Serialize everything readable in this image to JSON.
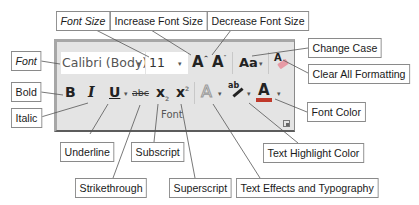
{
  "diagram": {
    "type": "annotated-ribbon-group",
    "ribbon_group": {
      "group_label": "Font",
      "font_name": {
        "value": "Calibri (Body)",
        "dropdown_icon": "chevron-down-icon"
      },
      "font_size": {
        "value": "11",
        "dropdown_icon": "chevron-down-icon"
      },
      "buttons": {
        "increase_font_size": {
          "glyph": "A",
          "icon": "increase-font-size-icon"
        },
        "decrease_font_size": {
          "glyph": "A",
          "icon": "decrease-font-size-icon"
        },
        "change_case": {
          "glyph": "Aa",
          "icon": "change-case-icon"
        },
        "clear_formatting": {
          "glyph": "A",
          "icon": "clear-formatting-icon"
        },
        "bold": {
          "glyph": "B",
          "icon": "bold-icon"
        },
        "italic": {
          "glyph": "I",
          "icon": "italic-icon"
        },
        "underline": {
          "glyph": "U",
          "icon": "underline-icon"
        },
        "strikethrough": {
          "glyph": "abc",
          "icon": "strikethrough-icon"
        },
        "subscript": {
          "glyph": "x",
          "sub": "2",
          "icon": "subscript-icon"
        },
        "superscript": {
          "glyph": "x",
          "sup": "2",
          "icon": "superscript-icon"
        },
        "text_effects": {
          "glyph": "A",
          "icon": "text-effects-icon"
        },
        "highlight": {
          "glyph": "ab",
          "icon": "highlighter-icon"
        },
        "font_color": {
          "glyph": "A",
          "icon": "font-color-icon",
          "color": "#c0392b"
        }
      }
    },
    "callouts": {
      "font": "Font",
      "font_size": "Font Size",
      "increase_font_size": "Increase Font Size",
      "decrease_font_size": "Decrease Font Size",
      "change_case": "Change Case",
      "clear_all_formatting": "Clear All Formatting",
      "bold": "Bold",
      "italic": "Italic",
      "underline": "Underline",
      "strikethrough": "Strikethrough",
      "subscript": "Subscript",
      "superscript": "Superscript",
      "text_effects": "Text Effects and Typography",
      "text_highlight_color": "Text Highlight Color",
      "font_color": "Font Color"
    }
  }
}
